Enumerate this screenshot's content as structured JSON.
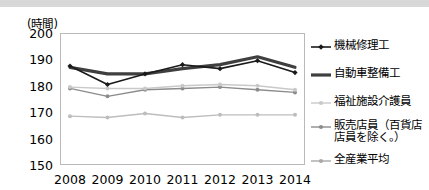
{
  "axis_unit_label": "(時間)",
  "y_ticks": [
    "200",
    "190",
    "180",
    "170",
    "160",
    "150"
  ],
  "x_ticks": [
    "2008",
    "2009",
    "2010",
    "2011",
    "2012",
    "2013",
    "2014"
  ],
  "legend": [
    {
      "label": "機械修理工",
      "label_line2": "",
      "color": "#1a1a1a",
      "width": 1.6,
      "marker": "diamond"
    },
    {
      "label": "自動車整備工",
      "label_line2": "",
      "color": "#3f3f3f",
      "width": 3.2,
      "marker": "none"
    },
    {
      "label": "福祉施設介護員",
      "label_line2": "",
      "color": "#c9c9c9",
      "width": 1.4,
      "marker": "circle"
    },
    {
      "label": "販売店員（百貨店",
      "label_line2": "店員を除く。）",
      "color": "#8c8c8c",
      "width": 1.4,
      "marker": "circle"
    },
    {
      "label": "全産業平均",
      "label_line2": "",
      "color": "#a8a8a8",
      "width": 1.4,
      "marker": "circle"
    }
  ],
  "chart_data": {
    "type": "line",
    "title": "",
    "subtitle": "",
    "xlabel": "",
    "ylabel": "(時間)",
    "x": [
      "2008",
      "2009",
      "2010",
      "2011",
      "2012",
      "2013",
      "2014"
    ],
    "ylim": [
      150,
      200
    ],
    "ytick_step": 10,
    "grid": false,
    "legend_position": "right",
    "series": [
      {
        "name": "機械修理工",
        "color": "#1a1a1a",
        "line_width": 1.6,
        "marker": "diamond",
        "values": [
          187.5,
          180.5,
          184.5,
          188.0,
          186.5,
          189.5,
          185.0
        ]
      },
      {
        "name": "自動車整備工",
        "color": "#3f3f3f",
        "line_width": 3.2,
        "marker": "none",
        "values": [
          187.0,
          184.5,
          184.5,
          186.5,
          188.0,
          191.0,
          187.0
        ]
      },
      {
        "name": "福祉施設介護員",
        "color": "#c9c9c9",
        "line_width": 1.4,
        "marker": "circle",
        "values": [
          179.5,
          179.0,
          179.0,
          180.0,
          180.5,
          180.0,
          178.5
        ]
      },
      {
        "name": "販売店員（百貨店店員を除く。）",
        "color": "#8c8c8c",
        "line_width": 1.4,
        "marker": "circle",
        "values": [
          179.0,
          176.0,
          178.5,
          179.0,
          179.5,
          178.5,
          177.5
        ]
      },
      {
        "name": "全産業平均",
        "color": "#bdbdbd",
        "line_width": 1.4,
        "marker": "circle",
        "values": [
          168.5,
          168.0,
          169.5,
          168.0,
          169.0,
          169.0,
          169.0
        ]
      }
    ]
  }
}
